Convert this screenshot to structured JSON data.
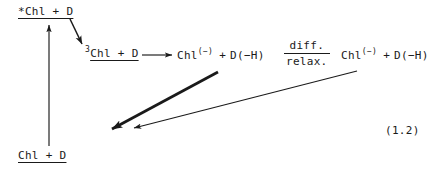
{
  "figure": {
    "equation_number": "(1.2)",
    "background_color": "#ffffff",
    "ink_color": "#1a1a1a"
  },
  "species": {
    "excited_singlet": {
      "label": "*Chl + D",
      "underlined": true
    },
    "triplet": {
      "presuperscript": "3",
      "label": "Chl + D",
      "underlined": true
    },
    "radical_pair_1": {
      "chl": "Chl",
      "chl_charge": "(−)",
      "plus": "+",
      "donor": "D(−H)"
    },
    "radical_pair_2": {
      "chl": "Chl",
      "chl_charge": "(−)",
      "plus": "+",
      "donor": "D(−H)"
    },
    "ground_state": {
      "label": "Chl + D",
      "underlined": true
    }
  },
  "conditions": {
    "diffusion_relaxation": {
      "numerator": "diff.",
      "denominator": "relax."
    }
  },
  "arrows": {
    "excitation": {
      "name": "ground-to-excited-arrow",
      "direction": "up",
      "weight": "thin"
    },
    "intersystem_crossing": {
      "name": "excited-to-triplet-arrow",
      "direction": "down-right",
      "weight": "medium"
    },
    "electron_transfer": {
      "name": "triplet-to-radical-pair-arrow",
      "direction": "right",
      "weight": "thin"
    },
    "recombination_thick": {
      "name": "radical-pair-1-to-ground-arrow",
      "direction": "down-left",
      "weight": "thick"
    },
    "recombination_thin": {
      "name": "radical-pair-2-to-ground-arrow",
      "direction": "down-left",
      "weight": "thin"
    }
  }
}
